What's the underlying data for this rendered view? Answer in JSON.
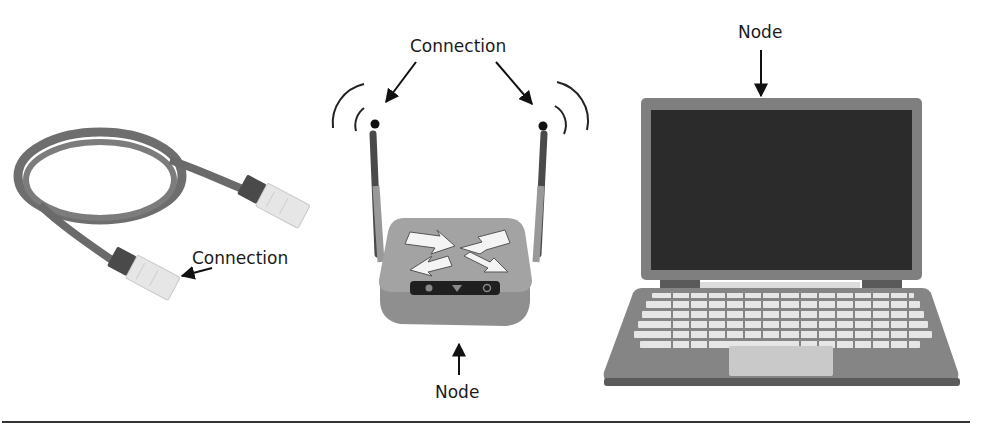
{
  "diagram": {
    "labels": {
      "cable_connection": "Connection",
      "router_connection": "Connection",
      "router_node": "Node",
      "laptop_node": "Node"
    },
    "components": [
      {
        "name": "ethernet-cable",
        "role": "Connection"
      },
      {
        "name": "wireless-router",
        "role": "Node",
        "antenna_role": "Connection"
      },
      {
        "name": "laptop",
        "role": "Node"
      }
    ],
    "router_status_icons": [
      "globe-icon",
      "wifi-icon",
      "power-icon"
    ],
    "colors": {
      "device_gray": "#8a8a8a",
      "dark_gray": "#4a4a4a",
      "screen": "#2b2b2b",
      "light": "#e8e8e8",
      "text": "#1a1a1a"
    }
  }
}
